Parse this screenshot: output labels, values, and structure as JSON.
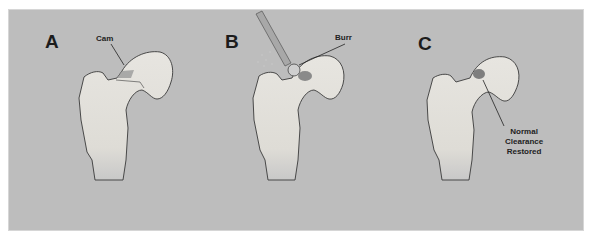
{
  "figure": {
    "panels": [
      {
        "letter": "A",
        "label": "Cam"
      },
      {
        "letter": "B",
        "label": "Burr"
      },
      {
        "letter": "C",
        "label_lines": [
          "Normal",
          "Clearance",
          "Restored"
        ]
      }
    ],
    "colors": {
      "background": "#bdbdbd",
      "bone": "#e6e4df",
      "outline": "#3a3a3a",
      "lesion": "#8e8e8e"
    }
  }
}
